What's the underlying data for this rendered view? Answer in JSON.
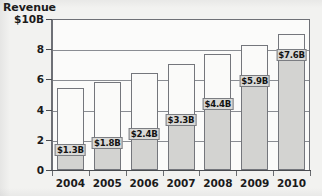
{
  "chart_data": {
    "type": "bar",
    "subtype": "stacked-bar",
    "title": "Revenue",
    "xlabel": "",
    "ylabel": "Revenue",
    "ylim": [
      0,
      10
    ],
    "grid": true,
    "grid_axis": "y",
    "legend": "none",
    "y_unit": "$B",
    "y_tick_labels": [
      "$10B",
      "8",
      "6",
      "4",
      "2",
      "0"
    ],
    "y_tick_values": [
      10,
      8,
      6,
      4,
      2,
      0
    ],
    "categories": [
      "2004",
      "2005",
      "2006",
      "2007",
      "2008",
      "2009",
      "2010"
    ],
    "series": [
      {
        "name": "lower-segment",
        "color": "#d3d3d1",
        "values": [
          1.3,
          1.8,
          2.4,
          3.3,
          4.4,
          5.9,
          7.6
        ],
        "data_labels": [
          "$1.3B",
          "$1.8B",
          "$2.4B",
          "$3.3B",
          "$4.4B",
          "$5.9B",
          "$7.6B"
        ]
      },
      {
        "name": "upper-segment",
        "color": "#fafaf9",
        "values": [
          4.1,
          4.0,
          4.0,
          3.7,
          3.3,
          2.4,
          1.4
        ],
        "data_labels": [
          "",
          "",
          "",
          "",
          "",
          "",
          ""
        ]
      }
    ],
    "totals": [
      5.4,
      5.8,
      6.4,
      7.0,
      7.7,
      8.3,
      9.0
    ],
    "annotations": []
  },
  "axes": {
    "y_title": "Revenue",
    "y_ticks": [
      {
        "label": "$10B",
        "value": 10
      },
      {
        "label": "8",
        "value": 8
      },
      {
        "label": "6",
        "value": 6
      },
      {
        "label": "4",
        "value": 4
      },
      {
        "label": "2",
        "value": 2
      },
      {
        "label": "0",
        "value": 0
      }
    ],
    "x_ticks": [
      {
        "label": "2004"
      },
      {
        "label": "2005"
      },
      {
        "label": "2006"
      },
      {
        "label": "2007"
      },
      {
        "label": "2008"
      },
      {
        "label": "2009"
      },
      {
        "label": "2010"
      }
    ]
  },
  "colors": {
    "background": "#f2f2f0",
    "plot_background": "#fbfbfa",
    "frame": "#6e7076",
    "gridline": "#8a8d93",
    "segment_lower": "#d3d3d1",
    "segment_upper": "#fafaf9",
    "bar_outline": "#74767c",
    "label_background": "#d9d9d7",
    "text": "#1b1b1b"
  }
}
